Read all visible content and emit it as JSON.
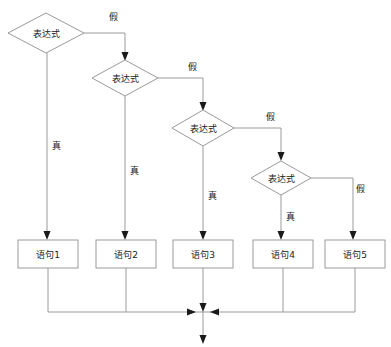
{
  "diagram": {
    "canvas": {
      "width": 391,
      "height": 347
    },
    "colors": {
      "shape_stroke": "#9a9a9a",
      "shape_fill": "#ffffff",
      "text": "#1a1a1a",
      "arrow": "#1a1a1a",
      "background": "#ffffff"
    },
    "decisions": [
      {
        "id": "d1",
        "label": "表达式",
        "cx": 46,
        "cy": 33,
        "rx": 38,
        "ry": 20
      },
      {
        "id": "d2",
        "label": "表达式",
        "cx": 125,
        "cy": 78,
        "rx": 33,
        "ry": 18
      },
      {
        "id": "d3",
        "label": "表达式",
        "cx": 203,
        "cy": 128,
        "rx": 31,
        "ry": 18
      },
      {
        "id": "d4",
        "label": "表达式",
        "cx": 281,
        "cy": 178,
        "rx": 30,
        "ry": 17
      }
    ],
    "statements": [
      {
        "id": "s1",
        "label": "语句1",
        "x": 18,
        "y": 240,
        "w": 60,
        "h": 28
      },
      {
        "id": "s2",
        "label": "语句2",
        "x": 96,
        "y": 240,
        "w": 60,
        "h": 28
      },
      {
        "id": "s3",
        "label": "语句3",
        "x": 175,
        "y": 240,
        "w": 60,
        "h": 28
      },
      {
        "id": "s4",
        "label": "语句4",
        "x": 253,
        "y": 240,
        "w": 60,
        "h": 28
      },
      {
        "id": "s5",
        "label": "语句5",
        "x": 325,
        "y": 240,
        "w": 60,
        "h": 28
      }
    ],
    "edge_labels": {
      "true_branches": [
        {
          "id": "t1",
          "label": "真",
          "x": 56,
          "y": 146
        },
        {
          "id": "t2",
          "label": "真",
          "x": 134,
          "y": 171
        },
        {
          "id": "t3",
          "label": "真",
          "x": 212,
          "y": 196
        },
        {
          "id": "t4",
          "label": "真",
          "x": 290,
          "y": 217
        }
      ],
      "false_branches": [
        {
          "id": "f1",
          "label": "假",
          "x": 113,
          "y": 17
        },
        {
          "id": "f2",
          "label": "假",
          "x": 192,
          "y": 67
        },
        {
          "id": "f3",
          "label": "假",
          "x": 270,
          "y": 117
        },
        {
          "id": "f4",
          "label": "假",
          "x": 359,
          "y": 189
        }
      ]
    },
    "merge": {
      "bus_y": 312,
      "bus_x_left": 48,
      "bus_x_right": 355,
      "exit_x": 203,
      "exit_y_end": 344
    }
  }
}
